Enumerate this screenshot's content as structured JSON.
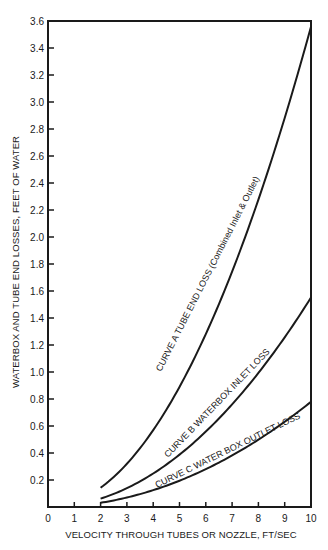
{
  "chart_data": {
    "type": "line",
    "title": "",
    "xlabel": "VELOCITY THROUGH TUBES OR NOZZLE, FT/SEC",
    "ylabel": "WATERBOX AND TUBE END LOSSES, FEET OF WATER",
    "xlim": [
      0,
      10
    ],
    "ylim": [
      0,
      3.6
    ],
    "x_ticks": [
      0,
      1,
      2,
      3,
      4,
      5,
      6,
      7,
      8,
      9,
      10
    ],
    "x_tick_labels": [
      "0",
      "1",
      "2",
      "3",
      "4",
      "5",
      "6",
      "7",
      "8",
      "9",
      "10"
    ],
    "y_ticks": [
      0.2,
      0.4,
      0.6,
      0.8,
      1.0,
      1.2,
      1.4,
      1.6,
      1.8,
      2.0,
      2.2,
      2.4,
      2.6,
      2.8,
      3.0,
      3.2,
      3.4,
      3.6
    ],
    "y_tick_labels": [
      "0.2",
      "0.4",
      "0.6",
      "0.8",
      "1.0",
      "1.2",
      "1.4",
      "1.6",
      "1.8",
      "2.0",
      "2.2",
      "2.4",
      "2.6",
      "2.8",
      "3.0",
      "3.2",
      "3.4",
      "3.6"
    ],
    "grid": false,
    "legend": "none (inline curve labels)",
    "x": [
      2,
      3,
      4,
      5,
      6,
      7,
      8,
      9,
      10
    ],
    "series": [
      {
        "name": "CURVE A TUBE END LOSS (Combined Inlet & Outlet)",
        "values": [
          0.14,
          0.32,
          0.57,
          0.89,
          1.28,
          1.74,
          2.28,
          2.88,
          3.56
        ]
      },
      {
        "name": "CURVE B WATERBOX INLET LOSS",
        "values": [
          0.06,
          0.14,
          0.25,
          0.39,
          0.56,
          0.76,
          0.99,
          1.26,
          1.55
        ]
      },
      {
        "name": "CURVE C WATER BOX OUTLET LOSS",
        "values": [
          0.03,
          0.07,
          0.12,
          0.2,
          0.28,
          0.38,
          0.5,
          0.63,
          0.78
        ]
      }
    ],
    "annotations": [
      "CURVE A TUBE END LOSS (Combined Inlet & Outlet)",
      "CURVE B WATERBOX INLET LOSS",
      "CURVE C WATER BOX OUTLET LOSS"
    ]
  },
  "labels": {
    "x_axis_title": "VELOCITY THROUGH TUBES OR NOZZLE, FT/SEC",
    "y_axis_title": "WATERBOX AND TUBE END LOSSES, FEET OF WATER",
    "curve_a": "CURVE A TUBE END LOSS  (Combined Inlet & Outlet)",
    "curve_b": "CURVE B  WATERBOX INLET LOSS",
    "curve_c": "CURVE C  WATER BOX OUTLET LOSS"
  },
  "colors": {
    "ink": "#1a1a1a",
    "background": "#ffffff"
  }
}
